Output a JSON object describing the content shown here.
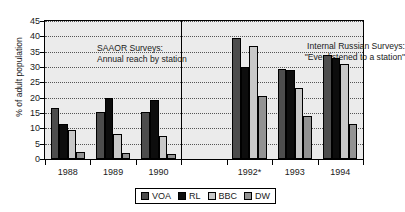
{
  "chart_data": {
    "type": "bar",
    "title": "",
    "xlabel": "",
    "ylabel": "% of adult population",
    "ylim": [
      0,
      45
    ],
    "ytick_step": 5,
    "grid": true,
    "legend_position": "bottom",
    "categories": [
      "1988",
      "1989",
      "1990",
      "",
      "1992*",
      "1993",
      "1994"
    ],
    "series": [
      {
        "name": "VOA",
        "color": "#4d4d4d",
        "values": [
          16.5,
          15.3,
          15.3,
          null,
          39.5,
          29.5,
          34.0
        ]
      },
      {
        "name": "RL",
        "color": "#0d0d0d",
        "values": [
          11.5,
          20.0,
          19.2,
          null,
          30.0,
          29.0,
          33.0
        ]
      },
      {
        "name": "BBC",
        "color": "#c8c8c8",
        "values": [
          9.3,
          8.0,
          7.5,
          null,
          37.0,
          23.0,
          31.0
        ]
      },
      {
        "name": "DW",
        "color": "#939393",
        "values": [
          2.3,
          2.0,
          1.7,
          null,
          20.5,
          14.0,
          11.5
        ]
      }
    ],
    "ytick_labels": [
      "0",
      "5",
      "10",
      "15",
      "20",
      "25",
      "30",
      "35",
      "40",
      "45"
    ],
    "annotations": [
      {
        "name": "left-panel-caption",
        "lines": [
          "SAAOR Surveys:",
          "Annual reach by station"
        ]
      },
      {
        "name": "right-panel-caption",
        "lines": [
          "Internal Russian Surveys:",
          "\"Ever listened to a station\""
        ]
      }
    ]
  },
  "axes": {
    "y_title": "% of adult population",
    "y_ticks": [
      "45",
      "40",
      "35",
      "30",
      "25",
      "20",
      "15",
      "10",
      "5",
      "0"
    ],
    "x_labels": [
      "1988",
      "1989",
      "1990",
      "",
      "1992*",
      "1993",
      "1994"
    ]
  },
  "captions": {
    "left_line1": "SAAOR Surveys:",
    "left_line2": "Annual reach by station",
    "right_line1": "Internal Russian Surveys:",
    "right_line2": "\"Ever listened to a station\""
  },
  "legend": {
    "items": [
      {
        "label": "VOA",
        "color": "#4d4d4d"
      },
      {
        "label": "RL",
        "color": "#0d0d0d"
      },
      {
        "label": "BBC",
        "color": "#c8c8c8"
      },
      {
        "label": "DW",
        "color": "#939393"
      }
    ]
  }
}
